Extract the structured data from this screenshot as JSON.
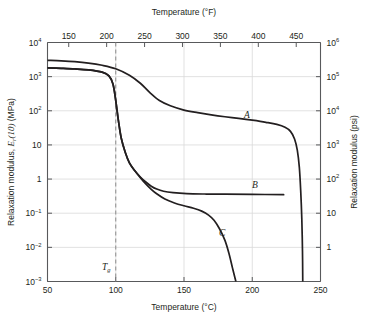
{
  "chart_data": {
    "type": "line",
    "title": "",
    "xlabel": "Temperature (°C)",
    "ylabel": "Relaxation modulus, Er(10) (MPa)",
    "xlabel_top": "Temperature (°F)",
    "ylabel_right": "Relaxation modulus (psi)",
    "xlim": [
      50,
      250
    ],
    "ylim": [
      0.001,
      10000
    ],
    "yscale": "log",
    "grid": true,
    "legend_position": "inline-annotations",
    "xticks": [
      "50",
      "100",
      "150",
      "200",
      "250"
    ],
    "xtick_values": [
      50,
      100,
      150,
      200,
      250
    ],
    "xticks_top": [
      "150",
      "200",
      "250",
      "300",
      "350",
      "400",
      "450"
    ],
    "xtick_top_values_f": [
      150,
      200,
      250,
      300,
      350,
      400,
      450
    ],
    "yticks": [
      {
        "base": "10",
        "sup": "4",
        "value": 10000
      },
      {
        "base": "10",
        "sup": "3",
        "value": 1000
      },
      {
        "base": "10",
        "sup": "2",
        "value": 100
      },
      {
        "base": "10",
        "sup": "",
        "value": 10
      },
      {
        "base": "1",
        "sup": "",
        "value": 1
      },
      {
        "base": "10",
        "sup": "-1",
        "value": 0.1
      },
      {
        "base": "10",
        "sup": "-2",
        "value": 0.01
      },
      {
        "base": "10",
        "sup": "-3",
        "value": 0.001
      }
    ],
    "yticks_right": [
      {
        "base": "10",
        "sup": "6",
        "value": 1000000
      },
      {
        "base": "10",
        "sup": "5",
        "value": 100000
      },
      {
        "base": "10",
        "sup": "4",
        "value": 10000
      },
      {
        "base": "10",
        "sup": "3",
        "value": 1000
      },
      {
        "base": "10",
        "sup": "2",
        "value": 100
      },
      {
        "base": "10",
        "sup": "",
        "value": 10
      },
      {
        "base": "1",
        "sup": "",
        "value": 1
      }
    ],
    "annotations": [
      {
        "text": "A",
        "x": 196,
        "y": 60
      },
      {
        "text": "B",
        "x": 202,
        "y": 0.55
      },
      {
        "text": "C",
        "x": 178,
        "y": 0.022
      },
      {
        "text": "Tg",
        "x": 93,
        "y": 0.0022
      }
    ],
    "reference_line": {
      "label": "Tg",
      "x": 100,
      "style": "dashed"
    },
    "series": [
      {
        "name": "A",
        "label": "A",
        "description": "Crystalline isotactic polystyrene",
        "points": [
          [
            50,
            3000
          ],
          [
            60,
            2900
          ],
          [
            70,
            2750
          ],
          [
            80,
            2500
          ],
          [
            90,
            2150
          ],
          [
            100,
            1700
          ],
          [
            110,
            1100
          ],
          [
            118,
            640
          ],
          [
            125,
            340
          ],
          [
            132,
            200
          ],
          [
            140,
            140
          ],
          [
            150,
            105
          ],
          [
            160,
            88
          ],
          [
            170,
            76
          ],
          [
            180,
            67
          ],
          [
            190,
            60
          ],
          [
            200,
            53
          ],
          [
            210,
            46
          ],
          [
            218,
            40
          ],
          [
            224,
            33
          ],
          [
            228,
            25
          ],
          [
            231,
            15
          ],
          [
            233,
            7
          ],
          [
            234.5,
            2.2
          ],
          [
            235.5,
            0.45
          ],
          [
            236.3,
            0.07
          ],
          [
            236.8,
            0.008
          ],
          [
            237,
            0.001
          ]
        ]
      },
      {
        "name": "B",
        "label": "B",
        "description": "Lightly crosslinked atactic polystyrene",
        "points": [
          [
            50,
            1800
          ],
          [
            60,
            1750
          ],
          [
            70,
            1680
          ],
          [
            80,
            1570
          ],
          [
            90,
            1350
          ],
          [
            95,
            1050
          ],
          [
            98,
            600
          ],
          [
            100,
            200
          ],
          [
            102,
            50
          ],
          [
            104,
            16
          ],
          [
            107,
            6.0
          ],
          [
            110,
            3.0
          ],
          [
            114,
            1.75
          ],
          [
            118,
            1.15
          ],
          [
            122,
            0.82
          ],
          [
            126,
            0.62
          ],
          [
            130,
            0.51
          ],
          [
            135,
            0.44
          ],
          [
            142,
            0.4
          ],
          [
            152,
            0.375
          ],
          [
            165,
            0.365
          ],
          [
            180,
            0.36
          ],
          [
            200,
            0.355
          ],
          [
            223,
            0.35
          ]
        ]
      },
      {
        "name": "C",
        "label": "C",
        "description": "Amorphous atactic polystyrene",
        "points": [
          [
            50,
            1800
          ],
          [
            60,
            1750
          ],
          [
            70,
            1680
          ],
          [
            80,
            1570
          ],
          [
            90,
            1350
          ],
          [
            95,
            1050
          ],
          [
            98,
            600
          ],
          [
            100,
            200
          ],
          [
            102,
            50
          ],
          [
            104,
            16
          ],
          [
            107,
            6.0
          ],
          [
            110,
            3.0
          ],
          [
            114,
            1.75
          ],
          [
            118,
            1.1
          ],
          [
            122,
            0.72
          ],
          [
            126,
            0.5
          ],
          [
            130,
            0.37
          ],
          [
            136,
            0.26
          ],
          [
            143,
            0.2
          ],
          [
            150,
            0.165
          ],
          [
            157,
            0.14
          ],
          [
            163,
            0.115
          ],
          [
            168,
            0.088
          ],
          [
            172,
            0.062
          ],
          [
            176,
            0.035
          ],
          [
            180,
            0.016
          ],
          [
            183,
            0.0065
          ],
          [
            185.5,
            0.0025
          ],
          [
            187.5,
            0.0012
          ],
          [
            188,
            0.001
          ]
        ]
      }
    ]
  },
  "colors": {
    "curve": "#231f20",
    "axis": "#58595b",
    "grid": "#d9d9d9",
    "text": "#231f20",
    "background": "#ffffff"
  }
}
